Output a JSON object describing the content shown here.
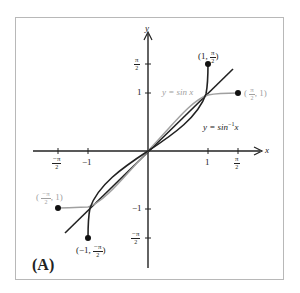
{
  "figure": {
    "panel_label": "(A)",
    "axes": {
      "x_label": "x",
      "y_label": "y",
      "x_ticks": [
        {
          "label_num": "−π",
          "label_den": "2",
          "value": -1.5708
        },
        {
          "label": "−1",
          "value": -1
        },
        {
          "label": "1",
          "value": 1
        },
        {
          "label_num": "π",
          "label_den": "2",
          "value": 1.5708
        }
      ],
      "y_ticks": [
        {
          "label_num": "π",
          "label_den": "2",
          "value": 1.5708
        },
        {
          "label": "1",
          "value": 1
        },
        {
          "label": "−1",
          "value": -1
        },
        {
          "label_num": "−π",
          "label_den": "2",
          "value": -1.5708
        }
      ]
    },
    "curves": {
      "sin": {
        "label": "y = sin x",
        "color": "#a0a0a0",
        "domain": "[-π/2, π/2]"
      },
      "arcsin": {
        "label_prefix": "y = sin",
        "label_sup": "−1",
        "label_suffix": "x",
        "color": "#222222",
        "domain": "[-1, 1]"
      },
      "identity": {
        "label": "y = x",
        "color": "#222222"
      }
    },
    "points": {
      "arcsin_top": {
        "open": "(1, ",
        "num": "π",
        "den": "2",
        "close": ")",
        "color": "#222222"
      },
      "arcsin_bottom": {
        "open": "(−1, ",
        "num": "−π",
        "den": "2",
        "close": ")",
        "color": "#222222"
      },
      "sin_right": {
        "open": "( ",
        "num": "π",
        "den": "2",
        "close": ", 1)",
        "color": "#a0a0a0"
      },
      "sin_left": {
        "open": "( ",
        "num": "−π",
        "den": "2",
        "close": ", 1)",
        "color": "#a0a0a0"
      }
    }
  }
}
